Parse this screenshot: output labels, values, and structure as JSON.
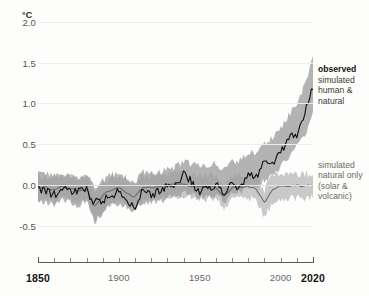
{
  "axes": {
    "unit_label": "°C",
    "y_ticks": [
      2.0,
      1.5,
      1.0,
      0.5,
      0.0,
      -0.5
    ],
    "y_tick_labels": [
      "2.0",
      "1.5",
      "1.0",
      "0.5",
      "0.0",
      "-0.5"
    ],
    "x_ticks": [
      1850,
      1900,
      1950,
      2000,
      2020
    ],
    "x_tick_labels": [
      "1850",
      "1900",
      "1950",
      "2000",
      "2020"
    ],
    "x_minor_step": 10
  },
  "legend": {
    "observed": {
      "title": "observed",
      "lines": [
        "simulated",
        "human &",
        "natural"
      ]
    },
    "natural_only": {
      "lines": [
        "simulated",
        "natural only",
        "(solar &",
        "volcanic)"
      ]
    }
  },
  "colors": {
    "observed_line": "#141414",
    "human_natural_band": "#9e9e9e",
    "natural_only_band": "#bfbfbf",
    "natural_only_line": "#6d6d6d",
    "gridline": "#ededea",
    "axis": "#5d5a56",
    "background": "#fdfdfc"
  },
  "chart_data": {
    "type": "line",
    "title": "",
    "subtitle": "",
    "xlabel": "",
    "ylabel": "°C",
    "xlim": [
      1850,
      2020
    ],
    "ylim": [
      -0.7,
      2.0
    ],
    "grid": true,
    "legend_position": "right",
    "annotations": [
      "observed",
      "simulated human & natural",
      "simulated natural only (solar & volcanic)"
    ],
    "x": [
      1850,
      1855,
      1860,
      1865,
      1870,
      1875,
      1880,
      1885,
      1890,
      1895,
      1900,
      1905,
      1910,
      1915,
      1920,
      1925,
      1930,
      1935,
      1940,
      1945,
      1950,
      1955,
      1960,
      1965,
      1970,
      1975,
      1980,
      1985,
      1990,
      1995,
      2000,
      2005,
      2010,
      2015,
      2020
    ],
    "series": [
      {
        "name": "observed",
        "type": "line",
        "color": "#141414",
        "values": [
          -0.05,
          -0.08,
          -0.12,
          -0.05,
          -0.1,
          -0.09,
          -0.06,
          -0.22,
          -0.2,
          -0.14,
          -0.08,
          -0.18,
          -0.26,
          -0.04,
          -0.12,
          -0.08,
          0.0,
          -0.02,
          0.12,
          0.04,
          -0.08,
          -0.06,
          0.0,
          -0.1,
          0.02,
          -0.05,
          0.18,
          0.08,
          0.32,
          0.28,
          0.4,
          0.58,
          0.62,
          0.9,
          1.22
        ]
      },
      {
        "name": "simulated human & natural",
        "type": "band",
        "color": "#9e9e9e",
        "lower": [
          -0.22,
          -0.2,
          -0.24,
          -0.18,
          -0.22,
          -0.26,
          -0.2,
          -0.46,
          -0.34,
          -0.26,
          -0.22,
          -0.28,
          -0.32,
          -0.2,
          -0.22,
          -0.2,
          -0.16,
          -0.16,
          -0.1,
          -0.12,
          -0.16,
          -0.14,
          -0.12,
          -0.2,
          -0.12,
          -0.1,
          0.0,
          -0.04,
          0.06,
          0.12,
          0.22,
          0.34,
          0.46,
          0.62,
          0.86
        ],
        "upper": [
          0.16,
          0.14,
          0.12,
          0.16,
          0.12,
          0.1,
          0.14,
          -0.04,
          0.06,
          0.12,
          0.14,
          0.08,
          0.04,
          0.16,
          0.14,
          0.16,
          0.2,
          0.22,
          0.28,
          0.26,
          0.22,
          0.24,
          0.26,
          0.18,
          0.28,
          0.3,
          0.4,
          0.38,
          0.5,
          0.58,
          0.7,
          0.86,
          1.0,
          1.22,
          1.58
        ]
      },
      {
        "name": "simulated natural only (solar & volcanic)",
        "type": "band",
        "color": "#bfbfbf",
        "lower": [
          -0.18,
          -0.16,
          -0.2,
          -0.16,
          -0.18,
          -0.22,
          -0.18,
          -0.44,
          -0.3,
          -0.22,
          -0.18,
          -0.24,
          -0.3,
          -0.18,
          -0.18,
          -0.16,
          -0.14,
          -0.14,
          -0.12,
          -0.14,
          -0.16,
          -0.16,
          -0.16,
          -0.3,
          -0.18,
          -0.16,
          -0.16,
          -0.18,
          -0.4,
          -0.2,
          -0.16,
          -0.16,
          -0.16,
          -0.16,
          -0.16
        ],
        "upper": [
          0.12,
          0.1,
          0.08,
          0.12,
          0.1,
          0.06,
          0.1,
          -0.08,
          0.04,
          0.1,
          0.1,
          0.06,
          0.0,
          0.12,
          0.12,
          0.12,
          0.14,
          0.14,
          0.14,
          0.12,
          0.12,
          0.12,
          0.12,
          0.0,
          0.12,
          0.12,
          0.12,
          0.1,
          -0.06,
          0.12,
          0.14,
          0.14,
          0.14,
          0.14,
          0.14
        ]
      },
      {
        "name": "simulated natural only (mean)",
        "type": "line",
        "color": "#6d6d6d",
        "values": [
          -0.03,
          -0.03,
          -0.06,
          -0.02,
          -0.04,
          -0.08,
          -0.04,
          -0.26,
          -0.13,
          -0.06,
          -0.04,
          -0.09,
          -0.15,
          -0.03,
          -0.03,
          -0.02,
          0.0,
          0.0,
          0.01,
          -0.01,
          -0.02,
          -0.02,
          -0.02,
          -0.15,
          -0.03,
          -0.02,
          -0.02,
          -0.04,
          -0.23,
          -0.04,
          -0.01,
          -0.01,
          -0.01,
          -0.01,
          -0.01
        ]
      }
    ]
  }
}
